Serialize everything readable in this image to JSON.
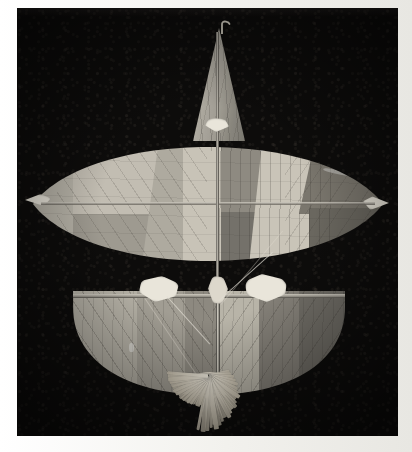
{
  "image": {
    "kind": "photograph",
    "subject": "traditional-kite",
    "title": "Traditional kite with lens-shaped wing and paper tassel",
    "orientation": "portrait",
    "width_px": 412,
    "height_px": 452,
    "has_text": false,
    "visible_text": ""
  },
  "print": {
    "border_color": "#f7f6f2",
    "border_left_px": 17,
    "border_top_px": 8,
    "border_right_px": 14,
    "border_bottom_px": 16
  },
  "background": {
    "name": "dark-studio-backdrop",
    "color": "#0d0c0b",
    "top_band_color": "#1d1b19",
    "texture": "fine photographic grain"
  },
  "palette": {
    "backdrop": "#0d0c0b",
    "paper_light": "#c9c5ba",
    "paper_mid": "#a9a59b",
    "paper_dark": "#6d6a63",
    "paper_darkest": "#55524c",
    "lashing_white": "#e9e5da",
    "tassel_white": "#efeadd",
    "spar_highlight": "#d3cfc4"
  },
  "kite": {
    "name": "kite",
    "parts": [
      {
        "name": "mast-sail",
        "label": "Upper triangular mast sail",
        "tone": "#a6a298"
      },
      {
        "name": "mast-hook",
        "label": "Hooked spine tip",
        "tone": "#cfcabd"
      },
      {
        "name": "spine",
        "label": "Vertical centre spine",
        "tone": "#c8c4ba"
      },
      {
        "name": "cross-spar",
        "label": "Horizontal cross spar",
        "tone": "#d7d3c9"
      },
      {
        "name": "upper-wing",
        "label": "Lens-shaped upper wing",
        "tone": "#adaa9f"
      },
      {
        "name": "lower-wing",
        "label": "Semicircular lower wing",
        "tone": "#9c988e"
      },
      {
        "name": "tassel",
        "label": "Paper strip tassel",
        "tone": "#efeadd"
      },
      {
        "name": "lashings",
        "label": "Binding lashings",
        "tone": "#e9e5da"
      },
      {
        "name": "bridle-lines",
        "label": "Bridle strings",
        "tone": "#e2ded4"
      }
    ],
    "upper_wing": {
      "name": "upper-wing",
      "shape": "vesica / lens",
      "left_px": 16,
      "top_px": 114,
      "width_px": 350,
      "height_px": 164,
      "panels": [
        {
          "name": "panel-far-left",
          "tone": "#b6b2a7",
          "x": 0,
          "y": 0,
          "w": 62,
          "h": 164
        },
        {
          "name": "panel-left-upper",
          "tone": "#c2bdb2",
          "x": 40,
          "y": 0,
          "w": 84,
          "h": 96
        },
        {
          "name": "panel-left-lower",
          "tone": "#9e9a90",
          "x": 40,
          "y": 92,
          "w": 84,
          "h": 72
        },
        {
          "name": "panel-left-wedge",
          "tone": "#a8a49a",
          "x": 112,
          "y": 0,
          "w": 54,
          "h": 164
        },
        {
          "name": "panel-centre-left",
          "tone": "#c6c1b5",
          "x": 150,
          "y": 0,
          "w": 36,
          "h": 164
        },
        {
          "name": "panel-centre-right",
          "tone": "#8e8a81",
          "x": 186,
          "y": 0,
          "w": 44,
          "h": 94
        },
        {
          "name": "panel-mid-dark",
          "tone": "#6f6c65",
          "x": 186,
          "y": 90,
          "w": 44,
          "h": 74
        },
        {
          "name": "panel-right-wedge",
          "tone": "#c8c4b8",
          "x": 224,
          "y": 0,
          "w": 70,
          "h": 160
        },
        {
          "name": "panel-right-dark",
          "tone": "#757168",
          "x": 272,
          "y": 0,
          "w": 78,
          "h": 90
        },
        {
          "name": "panel-right-lower",
          "tone": "#67645d",
          "x": 282,
          "y": 84,
          "w": 68,
          "h": 80
        }
      ],
      "tips": [
        {
          "name": "wing-tip-left",
          "x": 0,
          "y": 76
        },
        {
          "name": "wing-tip-right",
          "x": 338,
          "y": 76
        }
      ]
    },
    "lower_wing": {
      "name": "lower-wing",
      "shape": "semicircle",
      "left_px": 56,
      "top_px": 283,
      "width_px": 272,
      "height_px": 104,
      "panels": [
        {
          "name": "lower-panel-1",
          "tone": "#b3afa4",
          "x": 0,
          "y": 0,
          "w": 70,
          "h": 104
        },
        {
          "name": "lower-panel-2",
          "tone": "#a19d93",
          "x": 62,
          "y": 0,
          "w": 52,
          "h": 104
        },
        {
          "name": "lower-panel-3",
          "tone": "#8d8980",
          "x": 110,
          "y": 0,
          "w": 34,
          "h": 104
        },
        {
          "name": "lower-panel-4",
          "tone": "#b8b4a8",
          "x": 142,
          "y": 0,
          "w": 46,
          "h": 104
        },
        {
          "name": "lower-panel-5",
          "tone": "#807d75",
          "x": 186,
          "y": 0,
          "w": 42,
          "h": 104
        },
        {
          "name": "lower-panel-6",
          "tone": "#6e6b64",
          "x": 226,
          "y": 0,
          "w": 46,
          "h": 104
        }
      ]
    },
    "lashings": [
      {
        "name": "lashing-spine-top",
        "x": 186,
        "y": 112,
        "w": 22,
        "h": 13
      },
      {
        "name": "lashing-centre-hub",
        "x": 190,
        "y": 272,
        "w": 22,
        "h": 22
      },
      {
        "name": "lashing-left-joint",
        "x": 126,
        "y": 270,
        "w": 34,
        "h": 22
      },
      {
        "name": "lashing-right-joint",
        "x": 226,
        "y": 268,
        "w": 36,
        "h": 24
      },
      {
        "name": "lashing-tip-left",
        "x": 4,
        "y": 186,
        "w": 24,
        "h": 12
      },
      {
        "name": "lashing-tip-right",
        "x": 340,
        "y": 190,
        "w": 22,
        "h": 14
      }
    ],
    "tassel": {
      "name": "tassel",
      "strip_count": 46,
      "left_px": 96,
      "top_px": 364,
      "width_px": 190,
      "height_px": 66,
      "description": "fan of cut paper strips radiating from the spine foot"
    }
  }
}
